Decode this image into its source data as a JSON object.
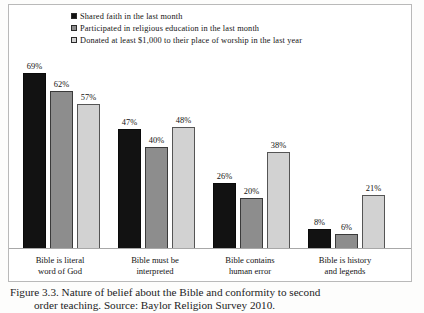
{
  "figure": {
    "caption_line1": "Figure 3.3. Nature of belief about the Bible and conformity to second",
    "caption_line2": "order teaching. Source: Baylor Religion Survey 2010."
  },
  "legend": {
    "items": [
      {
        "label": "Shared faith in the last month",
        "color": "#121212",
        "swatch_name": "legend-swatch-black"
      },
      {
        "label": "Participated in religious education in the last month",
        "color": "#8d8d8d",
        "swatch_name": "legend-swatch-gray"
      },
      {
        "label": "Donated at least $1,000 to their place of worship in the last year",
        "color": "#d2d2d2",
        "swatch_name": "legend-swatch-light"
      }
    ]
  },
  "chart_data": {
    "type": "bar",
    "title": "",
    "xlabel": "",
    "ylabel": "",
    "ylim": [
      0,
      80
    ],
    "grid": false,
    "legend_position": "top",
    "categories": [
      "Bible is literal word of God",
      "Bible must be interpreted",
      "Bible contains human error",
      "Bible is history and legends"
    ],
    "category_lines": [
      [
        "Bible is literal",
        "word of God"
      ],
      [
        "Bible must be",
        "interpreted"
      ],
      [
        "Bible contains",
        "human error"
      ],
      [
        "Bible is history",
        "and legends"
      ]
    ],
    "series": [
      {
        "name": "Shared faith in the last month",
        "color": "#121212",
        "values": [
          69,
          47,
          26,
          8
        ],
        "labels": [
          "69%",
          "47%",
          "26%",
          "8%"
        ]
      },
      {
        "name": "Participated in religious education in the last month",
        "color": "#8d8d8d",
        "values": [
          62,
          40,
          20,
          6
        ],
        "labels": [
          "62%",
          "40%",
          "20%",
          "6%"
        ]
      },
      {
        "name": "Donated at least $1,000 to their place of worship in the last year",
        "color": "#d2d2d2",
        "values": [
          57,
          48,
          38,
          21
        ],
        "labels": [
          "57%",
          "48%",
          "38%",
          "21%"
        ]
      }
    ]
  }
}
